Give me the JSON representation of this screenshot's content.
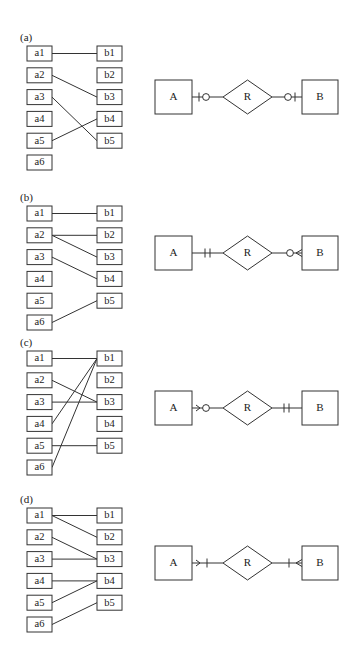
{
  "figure": {
    "panels": [
      {
        "label": "(a)",
        "top": 46,
        "left_items": [
          "a1",
          "a2",
          "a3",
          "a4",
          "a5",
          "a6"
        ],
        "right_items": [
          "b1",
          "b2",
          "b3",
          "b4",
          "b5"
        ],
        "mappings": [
          [
            0,
            0
          ],
          [
            1,
            2
          ],
          [
            2,
            4
          ],
          [
            4,
            3
          ]
        ],
        "er": {
          "entity_a": "A",
          "relationship": "R",
          "entity_b": "B",
          "a_side": "zero-or-one",
          "b_side": "zero-or-one",
          "cy": 97
        }
      },
      {
        "label": "(b)",
        "top": 206,
        "left_items": [
          "a1",
          "a2",
          "a3",
          "a4",
          "a5",
          "a6"
        ],
        "right_items": [
          "b1",
          "b2",
          "b3",
          "b4",
          "b5"
        ],
        "mappings": [
          [
            0,
            0
          ],
          [
            1,
            1
          ],
          [
            1,
            2
          ],
          [
            2,
            3
          ],
          [
            5,
            4
          ]
        ],
        "er": {
          "entity_a": "A",
          "relationship": "R",
          "entity_b": "B",
          "a_side": "exactly-one",
          "b_side": "zero-or-many",
          "cy": 253
        }
      },
      {
        "label": "(c)",
        "top": 351,
        "left_items": [
          "a1",
          "a2",
          "a3",
          "a4",
          "a5",
          "a6"
        ],
        "right_items": [
          "b1",
          "b2",
          "b3",
          "b4",
          "b5"
        ],
        "mappings": [
          [
            0,
            0
          ],
          [
            1,
            2
          ],
          [
            2,
            2
          ],
          [
            3,
            0
          ],
          [
            4,
            4
          ],
          [
            5,
            0
          ]
        ],
        "er": {
          "entity_a": "A",
          "relationship": "R",
          "entity_b": "B",
          "a_side": "zero-or-many",
          "b_side": "exactly-one",
          "cy": 408
        }
      },
      {
        "label": "(d)",
        "top": 508,
        "left_items": [
          "a1",
          "a2",
          "a3",
          "a4",
          "a5",
          "a6"
        ],
        "right_items": [
          "b1",
          "b2",
          "b3",
          "b4",
          "b5"
        ],
        "mappings": [
          [
            0,
            0
          ],
          [
            0,
            1
          ],
          [
            1,
            2
          ],
          [
            2,
            2
          ],
          [
            3,
            3
          ],
          [
            4,
            3
          ],
          [
            5,
            4
          ]
        ],
        "er": {
          "entity_a": "A",
          "relationship": "R",
          "entity_b": "B",
          "a_side": "one-or-many",
          "b_side": "one-or-many",
          "cy": 563
        }
      }
    ],
    "colors": {
      "stroke": "#333333",
      "text": "#222222",
      "background": "#ffffff"
    }
  }
}
